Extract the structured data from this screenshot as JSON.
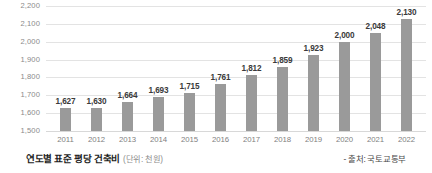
{
  "chart_data": {
    "type": "bar",
    "title": "",
    "xlabel": "",
    "ylabel": "",
    "ylim": [
      1500,
      2200
    ],
    "yticks": [
      "1,500",
      "1,600",
      "1,700",
      "1,800",
      "1,900",
      "2,000",
      "2,100",
      "2,200"
    ],
    "grid": true,
    "legend": "none",
    "categories": [
      "2011",
      "2012",
      "2013",
      "2014",
      "2015",
      "2016",
      "2017",
      "2018",
      "2019",
      "2020",
      "2021",
      "2022"
    ],
    "values": [
      1627,
      1630,
      1664,
      1693,
      1715,
      1761,
      1812,
      1859,
      1923,
      2000,
      2048,
      2130
    ],
    "value_labels": [
      "1,627",
      "1,630",
      "1,664",
      "1,693",
      "1,715",
      "1,761",
      "1,812",
      "1,859",
      "1,923",
      "2,000",
      "2,048",
      "2,130"
    ],
    "bar_color": "#9a9a9a",
    "gridline_color": "#e3e3e3"
  },
  "caption": {
    "title": "연도별 표준 평당 건축비",
    "unit": "(단위: 천원)",
    "source": "- 출처: 국토교통부"
  }
}
